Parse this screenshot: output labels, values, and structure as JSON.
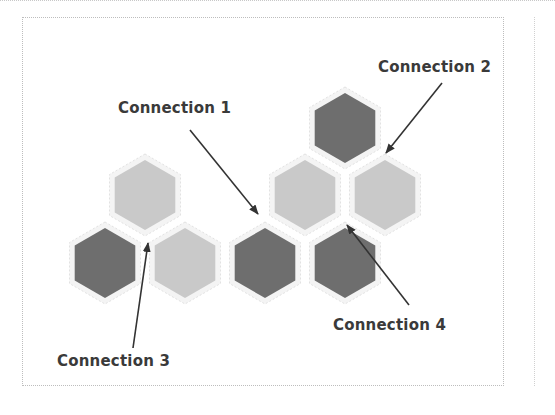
{
  "diagram": {
    "labels": [
      {
        "id": "c1",
        "text": "Connection 1"
      },
      {
        "id": "c2",
        "text": "Connection 2"
      },
      {
        "id": "c3",
        "text": "Connection 3"
      },
      {
        "id": "c4",
        "text": "Connection 4"
      }
    ],
    "colors": {
      "dark_hex": "#6e6e6e",
      "light_hex": "#c9c9c9",
      "arrow": "#333333",
      "label": "#3a3a3a"
    },
    "hexagons": [
      {
        "shade": "light",
        "cx": 145,
        "cy": 195
      },
      {
        "shade": "light",
        "cx": 305,
        "cy": 195
      },
      {
        "shade": "light",
        "cx": 385,
        "cy": 195
      },
      {
        "shade": "light",
        "cx": 185,
        "cy": 263
      },
      {
        "shade": "dark",
        "cx": 345,
        "cy": 128
      },
      {
        "shade": "dark",
        "cx": 105,
        "cy": 263
      },
      {
        "shade": "dark",
        "cx": 265,
        "cy": 263
      },
      {
        "shade": "dark",
        "cx": 345,
        "cy": 263
      }
    ]
  }
}
